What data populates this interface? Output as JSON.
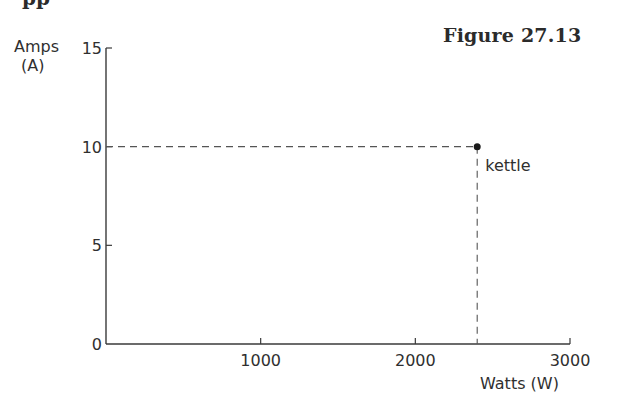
{
  "page": {
    "partial_heading": "pp",
    "figure_label": "Figure 27.13"
  },
  "chart_data": {
    "type": "scatter",
    "title": "Figure 27.13",
    "xlabel": "Watts (W)",
    "ylabel": "Amps (A)",
    "ylabel_line1": "Amps",
    "ylabel_line2": "(A)",
    "xlim": [
      0,
      3000
    ],
    "ylim": [
      0,
      15
    ],
    "x_ticks": [
      1000,
      2000,
      3000
    ],
    "x_tick_labels": [
      "1000",
      "2000",
      "3000"
    ],
    "y_ticks": [
      0,
      5,
      10,
      15
    ],
    "y_tick_labels": [
      "0",
      "5",
      "10",
      "15"
    ],
    "grid": false,
    "legend": null,
    "points": [
      {
        "label": "kettle",
        "x": 2400,
        "y": 10
      }
    ],
    "annotations": [
      {
        "text": "kettle",
        "x": 2400,
        "y": 10,
        "style": "dashed guide lines to both axes"
      }
    ]
  }
}
